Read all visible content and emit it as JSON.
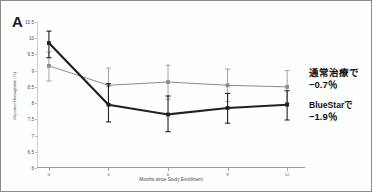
{
  "panel": {
    "label": "A"
  },
  "chart_data": {
    "type": "line",
    "title": "",
    "xlabel": "Months since Study Enrollment",
    "ylabel": "Glycated Hemoglobin (%)",
    "x": [
      0,
      3,
      6,
      9,
      12
    ],
    "xticklabels": [
      "0",
      "3",
      "6",
      "9",
      "12"
    ],
    "xlim": [
      -0.6,
      12.9
    ],
    "ylim": [
      6,
      10.5
    ],
    "yticks": [
      6,
      6.5,
      7,
      7.5,
      8,
      8.5,
      9,
      9.5,
      10,
      10.5
    ],
    "yticklabels": [
      "6",
      "6.5",
      "7",
      "7.5",
      "8",
      "8.5",
      "9",
      "9.5",
      "10",
      "10.5"
    ],
    "grid": false,
    "legend": "annotations-right",
    "series": [
      {
        "name": "BlueStar",
        "color": "#222222",
        "values": [
          9.85,
          7.95,
          7.65,
          7.85,
          7.95
        ],
        "err_low": [
          9.4,
          7.42,
          7.12,
          7.38,
          7.48
        ],
        "err_high": [
          10.22,
          8.6,
          8.22,
          8.3,
          8.38
        ]
      },
      {
        "name": "Usual Care",
        "color": "#8c8c8c",
        "values": [
          9.15,
          8.55,
          8.65,
          8.55,
          8.5
        ],
        "err_low": [
          8.68,
          7.98,
          8.12,
          8.05,
          8.02
        ],
        "err_high": [
          9.58,
          9.08,
          9.17,
          9.05,
          9.0
        ]
      }
    ]
  },
  "annotations": {
    "usual_care": {
      "title": "通常治療で",
      "value": "−0.7％"
    },
    "bluestar": {
      "title": "BlueStarで",
      "value": "−1.9％"
    }
  }
}
